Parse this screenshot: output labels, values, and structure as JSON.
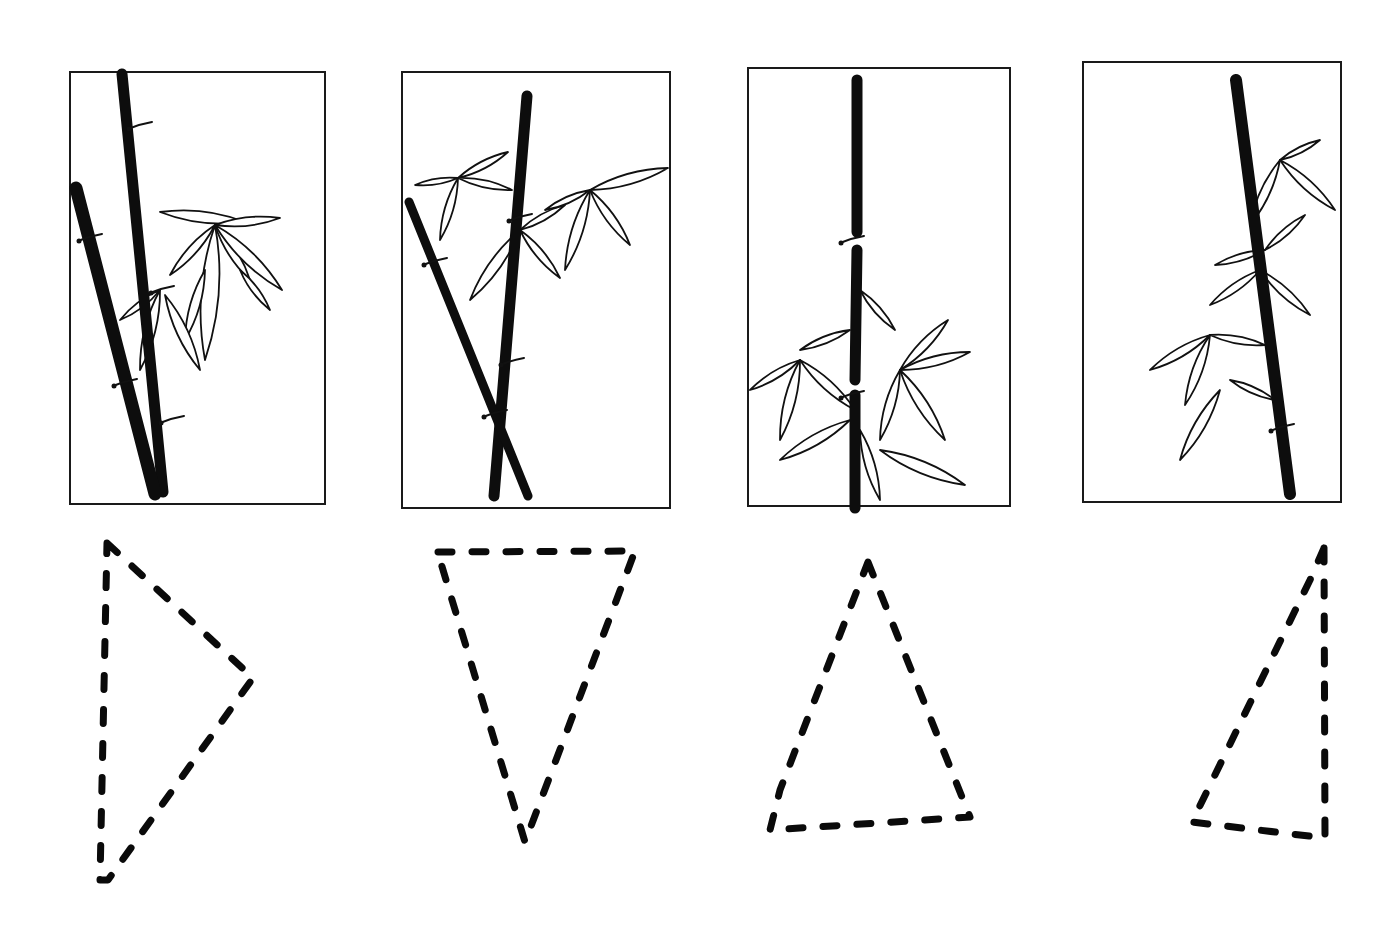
{
  "colors": {
    "background": "#ffffff",
    "ink": "#0d0d0d"
  },
  "panels": [
    {
      "name": "panel-1",
      "frame": [
        70,
        72,
        255,
        432
      ],
      "stalks": [
        {
          "pts": [
            [
              122,
              74
            ],
            [
              163,
              492
            ]
          ],
          "w": 11
        },
        {
          "pts": [
            [
              76,
              188
            ],
            [
              155,
              494
            ]
          ],
          "w": 13
        }
      ],
      "nodes": [
        [
          140,
          126
        ],
        [
          90,
          238
        ],
        [
          162,
          290
        ],
        [
          125,
          383
        ],
        [
          172,
          420
        ]
      ],
      "leaves": [
        [
          160,
          212,
          245,
          222
        ],
        [
          215,
          225,
          280,
          218
        ],
        [
          215,
          225,
          170,
          275
        ],
        [
          215,
          225,
          250,
          280
        ],
        [
          215,
          225,
          282,
          290
        ],
        [
          215,
          225,
          205,
          360
        ],
        [
          205,
          270,
          185,
          340
        ],
        [
          160,
          290,
          120,
          320
        ],
        [
          160,
          290,
          140,
          370
        ],
        [
          165,
          295,
          200,
          370
        ],
        [
          240,
          270,
          270,
          310
        ]
      ]
    },
    {
      "name": "panel-2",
      "frame": [
        402,
        72,
        268,
        436
      ],
      "stalks": [
        {
          "pts": [
            [
              527,
              96
            ],
            [
              494,
              496
            ]
          ],
          "w": 11
        },
        {
          "pts": [
            [
              409,
              202
            ],
            [
              528,
              496
            ]
          ],
          "w": 9
        }
      ],
      "nodes": [
        [
          520,
          218
        ],
        [
          435,
          262
        ],
        [
          512,
          362
        ],
        [
          495,
          414
        ]
      ],
      "leaves": [
        [
          458,
          178,
          508,
          152
        ],
        [
          458,
          178,
          415,
          185
        ],
        [
          458,
          178,
          512,
          190
        ],
        [
          458,
          178,
          440,
          240
        ],
        [
          520,
          230,
          470,
          300
        ],
        [
          520,
          230,
          560,
          278
        ],
        [
          520,
          230,
          565,
          205
        ],
        [
          590,
          190,
          668,
          168
        ],
        [
          590,
          190,
          630,
          245
        ],
        [
          590,
          190,
          565,
          270
        ],
        [
          590,
          190,
          545,
          210
        ]
      ]
    },
    {
      "name": "panel-3",
      "frame": [
        748,
        68,
        262,
        438
      ],
      "stalks": [
        {
          "pts": [
            [
              857,
              80
            ],
            [
              857,
              232
            ]
          ],
          "w": 11
        },
        {
          "pts": [
            [
              857,
              250
            ],
            [
              855,
              380
            ]
          ],
          "w": 11
        },
        {
          "pts": [
            [
              855,
              395
            ],
            [
              855,
              508
            ]
          ],
          "w": 11
        }
      ],
      "nodes": [
        [
          852,
          240
        ],
        [
          852,
          395
        ]
      ],
      "leaves": [
        [
          860,
          290,
          895,
          330
        ],
        [
          850,
          330,
          800,
          350
        ],
        [
          800,
          360,
          750,
          390
        ],
        [
          800,
          360,
          780,
          440
        ],
        [
          800,
          360,
          855,
          410
        ],
        [
          900,
          370,
          948,
          320
        ],
        [
          900,
          370,
          970,
          352
        ],
        [
          900,
          370,
          945,
          440
        ],
        [
          900,
          370,
          880,
          440
        ],
        [
          850,
          420,
          780,
          460
        ],
        [
          880,
          450,
          965,
          485
        ],
        [
          860,
          430,
          880,
          500
        ]
      ]
    },
    {
      "name": "panel-4",
      "frame": [
        1083,
        62,
        258,
        440
      ],
      "stalks": [
        {
          "pts": [
            [
              1236,
              80
            ],
            [
              1290,
              494
            ]
          ],
          "w": 12
        }
      ],
      "nodes": [
        [
          1282,
          428
        ]
      ],
      "leaves": [
        [
          1280,
          160,
          1320,
          140
        ],
        [
          1280,
          160,
          1335,
          210
        ],
        [
          1280,
          160,
          1250,
          225
        ],
        [
          1265,
          250,
          1305,
          215
        ],
        [
          1265,
          250,
          1215,
          265
        ],
        [
          1260,
          270,
          1210,
          305
        ],
        [
          1260,
          270,
          1310,
          315
        ],
        [
          1210,
          335,
          1150,
          370
        ],
        [
          1210,
          335,
          1265,
          345
        ],
        [
          1210,
          335,
          1185,
          405
        ],
        [
          1220,
          390,
          1180,
          460
        ],
        [
          1230,
          380,
          1275,
          400
        ]
      ]
    }
  ],
  "triangles": [
    {
      "name": "triangle-right-pointing",
      "pts": [
        [
          107,
          543
        ],
        [
          253,
          678
        ],
        [
          108,
          880
        ],
        [
          100,
          880
        ]
      ]
    },
    {
      "name": "triangle-inverted",
      "pts": [
        [
          438,
          552
        ],
        [
          635,
          551
        ],
        [
          525,
          842
        ],
        [
          440,
          560
        ]
      ]
    },
    {
      "name": "triangle-upright",
      "pts": [
        [
          868,
          562
        ],
        [
          970,
          817
        ],
        [
          770,
          830
        ],
        [
          780,
          790
        ]
      ]
    },
    {
      "name": "triangle-right-angle",
      "pts": [
        [
          1324,
          548
        ],
        [
          1325,
          838
        ],
        [
          1192,
          822
        ],
        [
          1310,
          580
        ]
      ]
    }
  ]
}
